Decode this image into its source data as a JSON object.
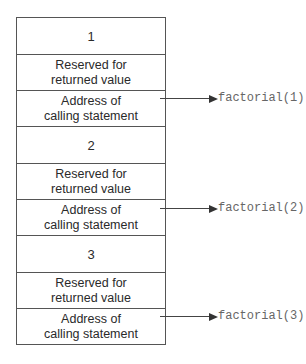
{
  "frames": [
    {
      "param": "1",
      "reserved": [
        "Reserved for",
        "returned value"
      ],
      "address": [
        "Address of",
        "calling statement"
      ],
      "call": "factorial(1)"
    },
    {
      "param": "2",
      "reserved": [
        "Reserved for",
        "returned value"
      ],
      "address": [
        "Address of",
        "calling statement"
      ],
      "call": "factorial(2)"
    },
    {
      "param": "3",
      "reserved": [
        "Reserved for",
        "returned value"
      ],
      "address": [
        "Address of",
        "calling statement"
      ],
      "call": "factorial(3)"
    }
  ]
}
